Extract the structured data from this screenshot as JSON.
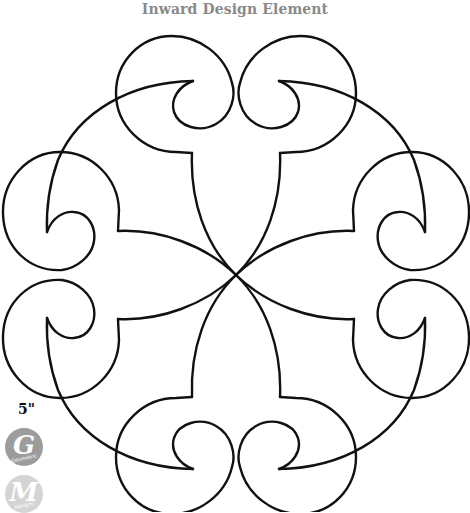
{
  "title": "Inward Design Element",
  "size_label": "5\"",
  "badges": [
    {
      "letter": "G",
      "subtext": "Geometric",
      "color": "#9c9c9c"
    },
    {
      "letter": "M",
      "subtext": "Designs",
      "color": "#d4d4d4"
    }
  ],
  "design": {
    "stroke_color": "#111111",
    "symmetry": "mirror-x-and-y",
    "lobe_count": 8
  }
}
